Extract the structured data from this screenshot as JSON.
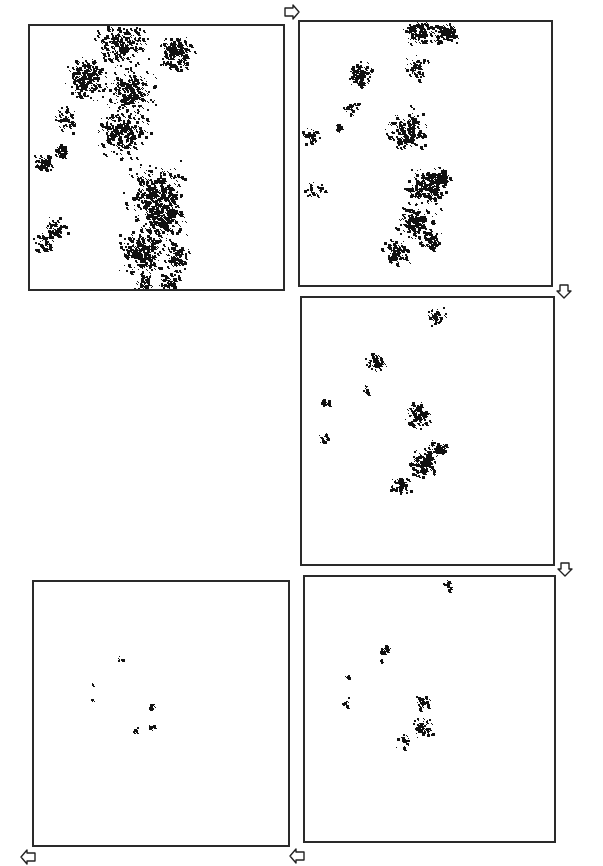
{
  "figure": {
    "background": "#ffffff",
    "border_color": "#2a2a2a",
    "dot_color": "#111111",
    "panels": [
      {
        "id": "panel-1",
        "stage": 1,
        "box": {
          "x": 28,
          "y": 24,
          "w": 257,
          "h": 267
        },
        "density": "very high",
        "clusters": [
          {
            "cx": 0.36,
            "cy": 0.06,
            "r": 0.1,
            "n": 260
          },
          {
            "cx": 0.57,
            "cy": 0.1,
            "r": 0.07,
            "n": 180
          },
          {
            "cx": 0.22,
            "cy": 0.2,
            "r": 0.08,
            "n": 220
          },
          {
            "cx": 0.4,
            "cy": 0.25,
            "r": 0.09,
            "n": 240
          },
          {
            "cx": 0.36,
            "cy": 0.4,
            "r": 0.1,
            "n": 250
          },
          {
            "cx": 0.14,
            "cy": 0.35,
            "r": 0.05,
            "n": 60
          },
          {
            "cx": 0.05,
            "cy": 0.52,
            "r": 0.04,
            "n": 70
          },
          {
            "cx": 0.12,
            "cy": 0.47,
            "r": 0.03,
            "n": 40
          },
          {
            "cx": 0.5,
            "cy": 0.63,
            "r": 0.11,
            "n": 300
          },
          {
            "cx": 0.52,
            "cy": 0.73,
            "r": 0.09,
            "n": 240
          },
          {
            "cx": 0.44,
            "cy": 0.86,
            "r": 0.09,
            "n": 260
          },
          {
            "cx": 0.58,
            "cy": 0.88,
            "r": 0.05,
            "n": 110
          },
          {
            "cx": 0.09,
            "cy": 0.77,
            "r": 0.05,
            "n": 60
          },
          {
            "cx": 0.05,
            "cy": 0.82,
            "r": 0.04,
            "n": 40
          },
          {
            "cx": 0.55,
            "cy": 0.97,
            "r": 0.04,
            "n": 60
          },
          {
            "cx": 0.45,
            "cy": 0.98,
            "r": 0.04,
            "n": 50
          }
        ]
      },
      {
        "id": "panel-2",
        "stage": 2,
        "box": {
          "x": 298,
          "y": 20,
          "w": 255,
          "h": 267
        },
        "density": "high",
        "clusters": [
          {
            "cx": 0.47,
            "cy": 0.03,
            "r": 0.06,
            "n": 120
          },
          {
            "cx": 0.58,
            "cy": 0.04,
            "r": 0.05,
            "n": 100
          },
          {
            "cx": 0.46,
            "cy": 0.17,
            "r": 0.05,
            "n": 50
          },
          {
            "cx": 0.24,
            "cy": 0.2,
            "r": 0.05,
            "n": 110
          },
          {
            "cx": 0.2,
            "cy": 0.33,
            "r": 0.03,
            "n": 25
          },
          {
            "cx": 0.42,
            "cy": 0.41,
            "r": 0.08,
            "n": 170
          },
          {
            "cx": 0.04,
            "cy": 0.43,
            "r": 0.03,
            "n": 45
          },
          {
            "cx": 0.15,
            "cy": 0.4,
            "r": 0.02,
            "n": 15
          },
          {
            "cx": 0.06,
            "cy": 0.64,
            "r": 0.04,
            "n": 30
          },
          {
            "cx": 0.5,
            "cy": 0.63,
            "r": 0.08,
            "n": 200
          },
          {
            "cx": 0.56,
            "cy": 0.59,
            "r": 0.04,
            "n": 80
          },
          {
            "cx": 0.46,
            "cy": 0.76,
            "r": 0.07,
            "n": 170
          },
          {
            "cx": 0.38,
            "cy": 0.87,
            "r": 0.05,
            "n": 110
          },
          {
            "cx": 0.52,
            "cy": 0.83,
            "r": 0.04,
            "n": 60
          }
        ]
      },
      {
        "id": "panel-3",
        "stage": 3,
        "box": {
          "x": 300,
          "y": 296,
          "w": 255,
          "h": 270
        },
        "density": "medium",
        "clusters": [
          {
            "cx": 0.53,
            "cy": 0.07,
            "r": 0.04,
            "n": 45
          },
          {
            "cx": 0.29,
            "cy": 0.24,
            "r": 0.04,
            "n": 60
          },
          {
            "cx": 0.25,
            "cy": 0.34,
            "r": 0.02,
            "n": 12
          },
          {
            "cx": 0.09,
            "cy": 0.39,
            "r": 0.02,
            "n": 20
          },
          {
            "cx": 0.09,
            "cy": 0.53,
            "r": 0.03,
            "n": 18
          },
          {
            "cx": 0.46,
            "cy": 0.44,
            "r": 0.05,
            "n": 90
          },
          {
            "cx": 0.48,
            "cy": 0.62,
            "r": 0.06,
            "n": 150
          },
          {
            "cx": 0.54,
            "cy": 0.56,
            "r": 0.03,
            "n": 50
          },
          {
            "cx": 0.39,
            "cy": 0.7,
            "r": 0.04,
            "n": 70
          }
        ]
      },
      {
        "id": "panel-4",
        "stage": 4,
        "box": {
          "x": 303,
          "y": 575,
          "w": 253,
          "h": 268
        },
        "density": "low",
        "clusters": [
          {
            "cx": 0.57,
            "cy": 0.03,
            "r": 0.02,
            "n": 14
          },
          {
            "cx": 0.32,
            "cy": 0.27,
            "r": 0.02,
            "n": 18
          },
          {
            "cx": 0.3,
            "cy": 0.32,
            "r": 0.01,
            "n": 4
          },
          {
            "cx": 0.17,
            "cy": 0.38,
            "r": 0.01,
            "n": 6
          },
          {
            "cx": 0.16,
            "cy": 0.47,
            "r": 0.02,
            "n": 10
          },
          {
            "cx": 0.47,
            "cy": 0.47,
            "r": 0.03,
            "n": 30
          },
          {
            "cx": 0.47,
            "cy": 0.57,
            "r": 0.04,
            "n": 55
          },
          {
            "cx": 0.4,
            "cy": 0.62,
            "r": 0.03,
            "n": 25
          }
        ]
      },
      {
        "id": "panel-5",
        "stage": 5,
        "box": {
          "x": 32,
          "y": 580,
          "w": 258,
          "h": 267
        },
        "density": "very low",
        "clusters": [
          {
            "cx": 0.34,
            "cy": 0.29,
            "r": 0.01,
            "n": 7
          },
          {
            "cx": 0.23,
            "cy": 0.39,
            "r": 0.005,
            "n": 2
          },
          {
            "cx": 0.23,
            "cy": 0.45,
            "r": 0.01,
            "n": 4
          },
          {
            "cx": 0.46,
            "cy": 0.47,
            "r": 0.015,
            "n": 10
          },
          {
            "cx": 0.4,
            "cy": 0.56,
            "r": 0.015,
            "n": 10
          },
          {
            "cx": 0.46,
            "cy": 0.55,
            "r": 0.015,
            "n": 12
          }
        ]
      }
    ],
    "arrows": [
      {
        "id": "arrow-1-to-2",
        "direction": "right",
        "x": 283,
        "y": 4
      },
      {
        "id": "arrow-2-to-3",
        "direction": "down",
        "x": 555,
        "y": 283
      },
      {
        "id": "arrow-3-to-4",
        "direction": "down",
        "x": 556,
        "y": 561
      },
      {
        "id": "arrow-4-to-5",
        "direction": "left",
        "x": 288,
        "y": 848
      },
      {
        "id": "arrow-5-end",
        "direction": "left",
        "x": 19,
        "y": 849
      }
    ]
  }
}
